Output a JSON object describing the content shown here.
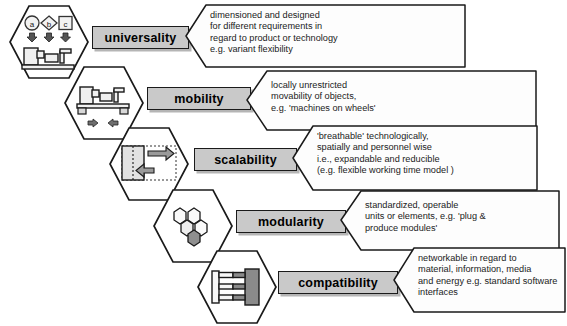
{
  "diagram": {
    "rows": [
      {
        "id": "universality",
        "label": "universality",
        "icon_name": "universality-hexagon-icon",
        "icon_description": "three workpiece symbols a, b, c with arrows pointing down to a machine",
        "icon_symbols": [
          "a",
          "b",
          "c"
        ],
        "callout_lines": [
          "dimensioned and designed",
          "for different requirements in",
          "regard to product or technology",
          "e.g. variant flexibility"
        ]
      },
      {
        "id": "mobility",
        "label": "mobility",
        "icon_name": "mobility-hexagon-icon",
        "icon_description": "machine mounted on wheels with left and right arrows",
        "icon_symbols": [],
        "callout_lines": [
          "locally unrestricted",
          "movability of objects,",
          "e.g. 'machines on wheels'"
        ]
      },
      {
        "id": "scalability",
        "label": "scalability",
        "icon_name": "scalability-hexagon-icon",
        "icon_description": "grey block with expanding right arrow and contracting left arrow inside dotted frame",
        "icon_symbols": [],
        "callout_lines": [
          "'breathable'  technologically,",
          "spatially and personnel wise",
          "i.e., expandable and reducible",
          "(e.g. flexible working time model )"
        ]
      },
      {
        "id": "modularity",
        "label": "modularity",
        "icon_name": "modularity-hexagon-icon",
        "icon_description": "honeycomb of five small hexagons with one highlighted dark",
        "icon_symbols": [],
        "callout_lines": [
          "standardized, operable",
          "units or elements, e.g. 'plug &",
          "produce modules'"
        ]
      },
      {
        "id": "compatibility",
        "label": "compatibility",
        "icon_name": "compatibility-hexagon-icon",
        "icon_description": "two interlocking comb shaped connectors, one white one dark grey",
        "icon_symbols": [],
        "callout_lines": [
          "networkable in regard to",
          "material, information, media",
          "and energy e.g. standard software",
          "interfaces"
        ]
      }
    ],
    "colors": {
      "chip_fill": "#c9c9c9",
      "callout_fill": "#fdfdfd",
      "outline": "#1a1a1a",
      "icon_light": "#f0f0f0",
      "icon_mid": "#d0d0d0",
      "icon_dark": "#8f8f8f"
    }
  }
}
